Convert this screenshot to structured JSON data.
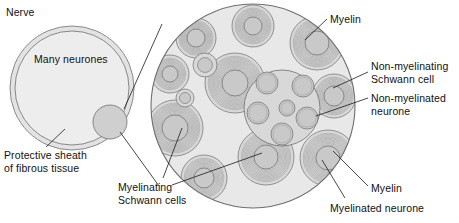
{
  "figure": {
    "title_alt": "Cross-section of a nerve showing myelinated and non-myelinated neurones",
    "background_color": "#ffffff",
    "ink_color": "#1b1b1b"
  },
  "colors": {
    "sheath_fill": "#e3e3e3",
    "nerve_fill": "#ededed",
    "fascicle_fill": "#cfcfcf",
    "magnified_fill": "#e8e8e8",
    "schwann_fill": "#d8d8d8",
    "axon_fill": "#c9c9c9",
    "myelin_ring": "#9a9a9a",
    "outline": "#6f6f6f",
    "leader_line": "#1b1b1b"
  },
  "labels": {
    "nerve": {
      "text": "Nerve",
      "x": 6,
      "y": 6
    },
    "many_neurones": {
      "text": "Many neurones",
      "x": 34,
      "y": 53
    },
    "protective_sheath": {
      "text": "Protective sheath\nof fibrous tissue",
      "x": 4,
      "y": 149
    },
    "myelinating_schwann_cells": {
      "text": "Myelinating\nSchwann cells",
      "x": 118,
      "y": 181
    },
    "myelin_top": {
      "text": "Myelin",
      "x": 330,
      "y": 13
    },
    "non_myelinating_schwann_cell": {
      "text": "Non-myelinating\nSchwann cell",
      "x": 371,
      "y": 60
    },
    "non_myelinated_neurone": {
      "text": "Non-myelinated\nneurone",
      "x": 371,
      "y": 92
    },
    "myelin_bottom": {
      "text": "Myelin",
      "x": 371,
      "y": 182
    },
    "myelinated_neurone": {
      "text": "Myelinated neurone",
      "x": 330,
      "y": 202
    }
  },
  "nerve_section": {
    "name": "nerve-cross-section",
    "center_x": 72,
    "center_y": 88,
    "outer_radius": 62,
    "inner_radius": 57,
    "fascicle": {
      "center_x": 110,
      "center_y": 122,
      "radius": 17
    }
  },
  "magnified_section": {
    "name": "magnified-fascicle",
    "center_x": 253,
    "center_y": 106,
    "radius": 102,
    "myelinated_neurones": [
      {
        "cx": 196,
        "cy": 38,
        "r_outer": 20,
        "r_axon": 9,
        "rings": 9
      },
      {
        "cx": 253,
        "cy": 26,
        "r_outer": 21,
        "r_axon": 9,
        "rings": 9
      },
      {
        "cx": 317,
        "cy": 43,
        "r_outer": 27,
        "r_axon": 12,
        "rings": 11
      },
      {
        "cx": 334,
        "cy": 96,
        "r_outer": 22,
        "r_axon": 10,
        "rings": 9
      },
      {
        "cx": 328,
        "cy": 158,
        "r_outer": 28,
        "r_axon": 12,
        "rings": 11
      },
      {
        "cx": 266,
        "cy": 157,
        "r_outer": 28,
        "r_axon": 12,
        "rings": 11
      },
      {
        "cx": 204,
        "cy": 178,
        "r_outer": 23,
        "r_axon": 10,
        "rings": 9
      },
      {
        "cx": 175,
        "cy": 128,
        "r_outer": 28,
        "r_axon": 13,
        "rings": 11
      },
      {
        "cx": 170,
        "cy": 74,
        "r_outer": 19,
        "r_axon": 8,
        "rings": 8
      },
      {
        "cx": 235,
        "cy": 83,
        "r_outer": 30,
        "r_axon": 13,
        "rings": 12
      }
    ],
    "small_unmyelinated_top": [
      {
        "cx": 205,
        "cy": 65,
        "r": 12
      },
      {
        "cx": 185,
        "cy": 98,
        "r": 9
      }
    ],
    "non_myelinating_schwann_cell": {
      "cx": 282,
      "cy": 108,
      "r": 38,
      "enclosed_neurones": [
        {
          "cx": 267,
          "cy": 83,
          "r": 11
        },
        {
          "cx": 303,
          "cy": 86,
          "r": 11
        },
        {
          "cx": 258,
          "cy": 113,
          "r": 11
        },
        {
          "cx": 307,
          "cy": 118,
          "r": 11
        },
        {
          "cx": 282,
          "cy": 134,
          "r": 11
        },
        {
          "cx": 287,
          "cy": 108,
          "r": 8
        }
      ]
    }
  },
  "leader_lines": [
    {
      "name": "leader-protective-sheath",
      "x1": 46,
      "y1": 147,
      "x2": 65,
      "y2": 129
    },
    {
      "name": "leader-myelinating-schwann-cells-a",
      "x1": 163,
      "y1": 178,
      "x2": 182,
      "y2": 128
    },
    {
      "name": "leader-myelinating-schwann-cells-b",
      "x1": 172,
      "y1": 185,
      "x2": 262,
      "y2": 153
    },
    {
      "name": "leader-myelin-top",
      "x1": 327,
      "y1": 19,
      "x2": 305,
      "y2": 40
    },
    {
      "name": "leader-non-myelinating-schwann",
      "x1": 368,
      "y1": 72,
      "x2": 333,
      "y2": 88
    },
    {
      "name": "leader-non-myelinated-neurone",
      "x1": 368,
      "y1": 98,
      "x2": 316,
      "y2": 116
    },
    {
      "name": "leader-myelin-bottom",
      "x1": 368,
      "y1": 186,
      "x2": 333,
      "y2": 151
    },
    {
      "name": "leader-myelinated-neurone",
      "x1": 345,
      "y1": 198,
      "x2": 322,
      "y2": 160
    }
  ],
  "magnification_cone": [
    {
      "name": "cone-line-upper",
      "x1": 124,
      "y1": 109,
      "x2": 162,
      "y2": 24
    },
    {
      "name": "cone-line-lower",
      "x1": 120,
      "y1": 132,
      "x2": 159,
      "y2": 186
    }
  ]
}
